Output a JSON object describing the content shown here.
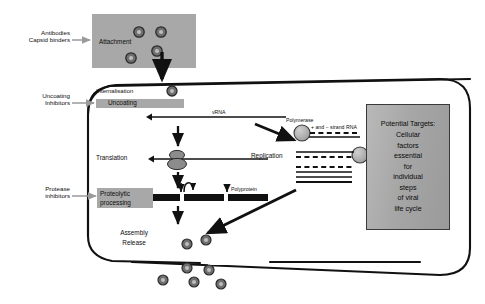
{
  "diagram": {
    "type": "flow-diagram"
  },
  "colors": {
    "box_gray": "#a0a0a0",
    "panel_gray": "#aaaaaa",
    "virion_gray": "#6f6f6f",
    "stroke_black": "#111111",
    "arrow_gray": "#9a9a9a"
  },
  "inhibitors": [
    {
      "id": "attachment",
      "line1": "Antibodies",
      "line2": "Capsid binders"
    },
    {
      "id": "uncoating",
      "line1": "Uncoating",
      "line2": "Inhibitors"
    },
    {
      "id": "protease",
      "line1": "Protease",
      "line2": "inhibitors"
    }
  ],
  "stages": {
    "attachment": "Attachment",
    "internalisation": "Internalisation",
    "uncoating": "Uncoating",
    "translation": "Translation",
    "replication": "Replication",
    "proteolytic_line1": "Proteolytic",
    "proteolytic_line2": "processing",
    "assembly": "Assembly",
    "release": "Release"
  },
  "molecules": {
    "vrna": "vRNA",
    "polymerase": "Polymerase",
    "strand_rna": "+ and − strand RNA",
    "polyprotein": "Polyprotein"
  },
  "targets_panel": {
    "lines": [
      "Potential Targets:",
      "Cellular",
      "factors",
      "essential",
      "for",
      "individual",
      "steps",
      "of viral",
      "life cycle"
    ]
  }
}
